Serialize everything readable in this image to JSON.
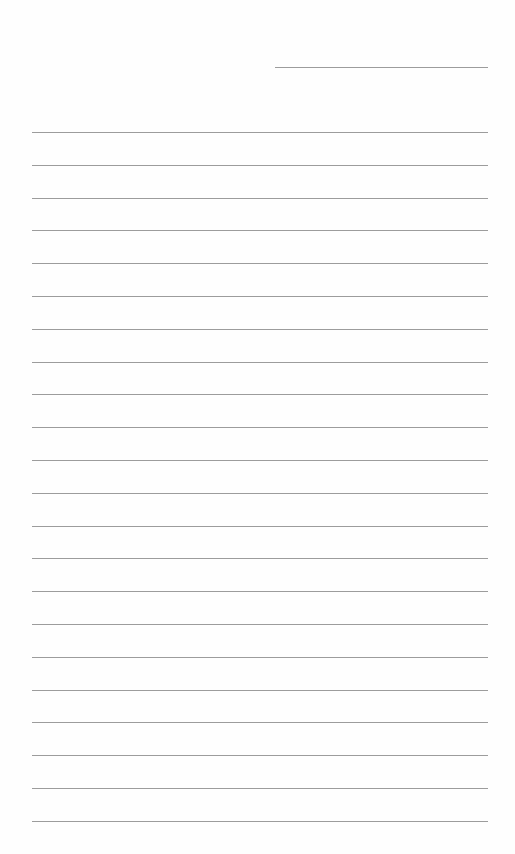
{
  "page": {
    "type": "lined-paper",
    "background_color": "#ffffff",
    "line_color": "#9c9c9c",
    "header_line": {
      "x_start": 275,
      "x_end": 488,
      "y": 67,
      "text": ""
    },
    "rules": {
      "count": 22,
      "x_start": 32,
      "x_end": 488,
      "first_y": 132,
      "spacing": 32.8
    },
    "lines_text": [
      "",
      "",
      "",
      "",
      "",
      "",
      "",
      "",
      "",
      "",
      "",
      "",
      "",
      "",
      "",
      "",
      "",
      "",
      "",
      "",
      "",
      ""
    ]
  }
}
